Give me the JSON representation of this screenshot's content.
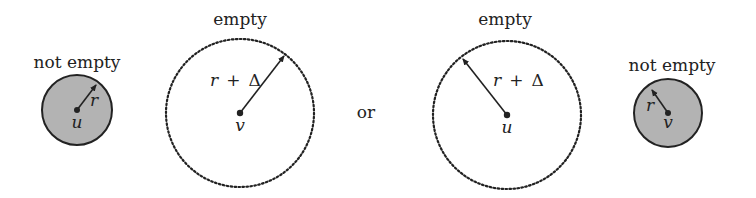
{
  "diagram": {
    "panels": [
      {
        "id": "left-not-empty",
        "label": "not empty",
        "center_label": "u",
        "radius_label": "r",
        "fill": "#b3b3b3",
        "style": "solid"
      },
      {
        "id": "left-empty",
        "label": "empty",
        "center_label": "v",
        "radius_label_var": "r",
        "radius_label_op": "+",
        "radius_label_delta": "Δ",
        "style": "dotted"
      },
      {
        "id": "right-empty",
        "label": "empty",
        "center_label": "u",
        "radius_label_var": "r",
        "radius_label_op": "+",
        "radius_label_delta": "Δ",
        "style": "dotted"
      },
      {
        "id": "right-not-empty",
        "label": "not empty",
        "center_label": "v",
        "radius_label": "r",
        "fill": "#b3b3b3",
        "style": "solid"
      }
    ],
    "separator": "or",
    "colors": {
      "stroke": "#222222",
      "gray_fill": "#b3b3b3"
    }
  }
}
